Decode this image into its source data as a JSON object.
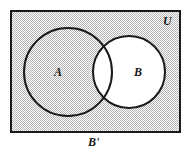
{
  "figure": {
    "type": "venn-diagram",
    "universe_label": "U",
    "set_a_label": "A",
    "set_b_label": "B",
    "shaded_region_label": "B'",
    "colors": {
      "outline": "#1a1a1a",
      "shading": "#c9c9c9",
      "shading_light": "#e2e2e2",
      "background": "#ffffff"
    },
    "geometry": {
      "rectangle": {
        "x": 11,
        "y": 11,
        "width": 169,
        "height": 121
      },
      "circle_a": {
        "cx": 68,
        "cy": 72,
        "r": 44
      },
      "circle_b": {
        "cx": 129,
        "cy": 72,
        "r": 36
      }
    }
  }
}
